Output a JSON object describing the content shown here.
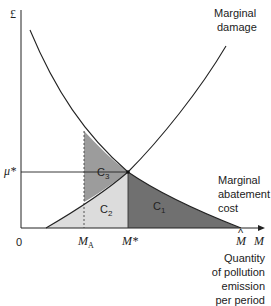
{
  "diagram": {
    "y_axis_label": "£",
    "x_axis_label": "M",
    "origin_label": "0",
    "x_axis_caption": [
      "Quantity",
      "of pollution",
      "emission",
      "per period"
    ],
    "curves": {
      "marginal_damage": {
        "label_lines": [
          "Marginal",
          "damage"
        ]
      },
      "marginal_abatement_cost": {
        "label_lines": [
          "Marginal",
          "abatement",
          "cost"
        ]
      }
    },
    "y_ticks": {
      "mu_star": "μ*"
    },
    "x_ticks": {
      "m_a_main": "M",
      "m_a_sub": "A",
      "m_star": "M*",
      "m_hat": "M",
      "m_hat_accent": "^"
    },
    "regions": [
      {
        "id": "C1",
        "label_main": "C",
        "label_sub": "1",
        "color": "#707070"
      },
      {
        "id": "C2",
        "label_main": "C",
        "label_sub": "2",
        "color": "#dcdcdc"
      },
      {
        "id": "C3",
        "label_main": "C",
        "label_sub": "3",
        "color": "#9c9c9c"
      }
    ],
    "colors": {
      "line": "#222222",
      "background": "#ffffff"
    }
  }
}
